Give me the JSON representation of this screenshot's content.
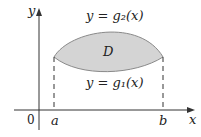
{
  "diagram": {
    "region_label": "D",
    "upper_curve_label": "y = g₂(x)",
    "lower_curve_label": "y = g₁(x)",
    "x_axis_label": "x",
    "y_axis_label": "y",
    "origin_label": "0",
    "left_bound_label": "a",
    "right_bound_label": "b",
    "region_fill_color": "#d4d4d4",
    "curve_color": "#8a8a8a",
    "axis_color": "#333333"
  }
}
